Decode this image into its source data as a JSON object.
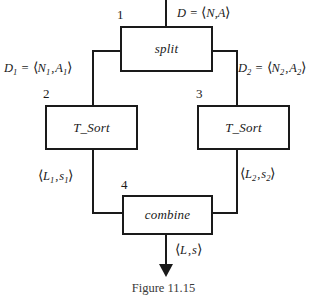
{
  "figure": {
    "caption": "Figure 11.15",
    "line_color": "#1a1a1a",
    "background_color": "#ffffff"
  },
  "nodes": [
    {
      "id": "split",
      "number": "1",
      "label": "split",
      "x": 120,
      "y": 26,
      "w": 93,
      "h": 46
    },
    {
      "id": "tsort_l",
      "number": "2",
      "label": "T_Sort",
      "x": 45,
      "y": 105,
      "w": 93,
      "h": 45
    },
    {
      "id": "tsort_r",
      "number": "3",
      "label": "T_Sort",
      "x": 197,
      "y": 105,
      "w": 93,
      "h": 45
    },
    {
      "id": "combine",
      "number": "4",
      "label": "combine",
      "x": 122,
      "y": 195,
      "w": 91,
      "h": 40
    }
  ],
  "edges": {
    "input": {
      "name": "D",
      "eq": "=",
      "tuple_open": "⟨",
      "tuple_close": "⟩",
      "tuple": "N,A",
      "full_text": "D = ⟨N,A⟩"
    },
    "split_left": {
      "name": "D",
      "name_sub": "1",
      "eq": "=",
      "tuple_open": "⟨",
      "tuple_close": "⟩",
      "t1": "N",
      "t1_sub": "1",
      "sep": ",",
      "t2": "A",
      "t2_sub": "1",
      "full_text": "D₁ = ⟨N₁,A₁⟩"
    },
    "split_right": {
      "name": "D",
      "name_sub": "2",
      "eq": "=",
      "tuple_open": "⟨",
      "tuple_close": "⟩",
      "t1": "N",
      "t1_sub": "2",
      "sep": ",",
      "t2": "A",
      "t2_sub": "2",
      "full_text": "D₂ = ⟨N₂,A₂⟩"
    },
    "sort_left_out": {
      "tuple_open": "⟨",
      "tuple_close": "⟩",
      "t1": "L",
      "t1_sub": "1",
      "sep": ",",
      "t2": "s",
      "t2_sub": "1",
      "full_text": "⟨L₁,s₁⟩"
    },
    "sort_right_out": {
      "tuple_open": "⟨",
      "tuple_close": "⟩",
      "t1": "L",
      "t1_sub": "2",
      "sep": ",",
      "t2": "s",
      "t2_sub": "2",
      "full_text": "⟨L₂,s₂⟩"
    },
    "output": {
      "tuple_open": "⟨",
      "tuple_close": "⟩",
      "t1": "L",
      "sep": ",",
      "t2": "s",
      "full_text": "⟨L,s⟩"
    }
  }
}
